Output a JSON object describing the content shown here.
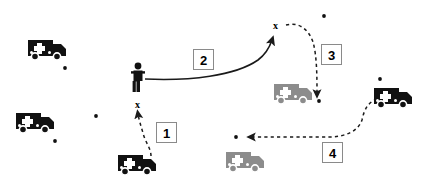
{
  "diagram": {
    "background_color": "#ffffff",
    "width": 426,
    "height": 192,
    "colors": {
      "vehicle_active": "#111111",
      "vehicle_inactive": "#8c8c8c",
      "person": "#111111",
      "arrow": "#1a1a1a",
      "label_border": "#8a8a8a",
      "label_text": "#000000",
      "dot": "#111111"
    }
  },
  "steps": [
    {
      "id": "step-1",
      "label": "1",
      "style": "dashed",
      "x": 156,
      "y": 122,
      "path": "M 151,156 C 151,148 145,142 143,133 C 141,126 139,120 138,114",
      "from": "ambulance-bottom-center",
      "to": "x-marker-lower"
    },
    {
      "id": "step-2",
      "label": "2",
      "style": "solid",
      "x": 193,
      "y": 49,
      "path": "M 145,79 C 190,81 235,76 258,60 C 266,54 270,46 272,40",
      "from": "person-figure",
      "to": "x-marker-upper"
    },
    {
      "id": "step-3",
      "label": "3",
      "style": "dashed",
      "x": 321,
      "y": 44,
      "path": "M 286,25 C 298,22 308,28 313,42 C 317,56 317,78 317,94",
      "from": "x-marker-upper",
      "to": "ambulance-grey-upper"
    },
    {
      "id": "step-4",
      "label": "4",
      "style": "dashed",
      "x": 322,
      "y": 142,
      "path": "M 377,99 C 368,102 364,110 362,120 C 358,132 344,137 328,137 C 305,137 272,137 251,137",
      "from": "ambulance-right",
      "to": "dot-target-left"
    }
  ],
  "vehicles": [
    {
      "id": "ambulance-top-left",
      "name": "ambulance-icon",
      "state": "active",
      "x": 28,
      "y": 38
    },
    {
      "id": "ambulance-mid-left",
      "name": "ambulance-icon",
      "state": "active",
      "x": 16,
      "y": 111
    },
    {
      "id": "ambulance-bottom-center",
      "name": "ambulance-icon",
      "state": "active",
      "x": 118,
      "y": 153
    },
    {
      "id": "ambulance-right",
      "name": "ambulance-icon",
      "state": "active",
      "x": 374,
      "y": 86
    },
    {
      "id": "ambulance-grey-upper",
      "name": "ambulance-icon",
      "state": "inactive",
      "x": 274,
      "y": 82
    },
    {
      "id": "ambulance-grey-lower",
      "name": "ambulance-icon",
      "state": "inactive",
      "x": 226,
      "y": 150
    }
  ],
  "person": {
    "id": "person-figure",
    "name": "person-icon",
    "x": 131,
    "y": 62
  },
  "x_markers": [
    {
      "id": "x-marker-lower",
      "label": "x",
      "x": 135,
      "y": 100
    },
    {
      "id": "x-marker-upper",
      "label": "x",
      "x": 273,
      "y": 21
    }
  ],
  "dots": [
    {
      "id": "dot-1",
      "x": 65,
      "y": 68
    },
    {
      "id": "dot-2",
      "x": 55,
      "y": 141
    },
    {
      "id": "dot-3",
      "x": 96,
      "y": 116
    },
    {
      "id": "dot-4",
      "x": 324,
      "y": 16
    },
    {
      "id": "dot-5",
      "x": 319,
      "y": 101
    },
    {
      "id": "dot-6",
      "x": 380,
      "y": 79
    },
    {
      "id": "dot-target-left",
      "x": 236,
      "y": 137
    }
  ]
}
